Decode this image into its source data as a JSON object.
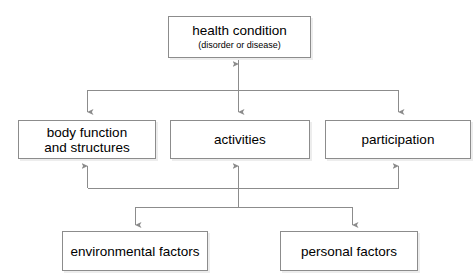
{
  "diagram": {
    "type": "flow-diagram",
    "background_color": "#ffffff",
    "line_color": "#8c8c8c",
    "box_border_color": "#8c8c8c",
    "box_fill_color": "#ffffff",
    "text_color": "#000000",
    "nodes": [
      {
        "id": "health_condition",
        "title": "health condition",
        "subtitle": "(disorder or disease)",
        "row": "top"
      },
      {
        "id": "body_function",
        "title": "body function\nand structures",
        "subtitle": "",
        "row": "middle"
      },
      {
        "id": "activities",
        "title": "activities",
        "subtitle": "",
        "row": "middle"
      },
      {
        "id": "participation",
        "title": "participation",
        "subtitle": "",
        "row": "middle"
      },
      {
        "id": "environmental_factors",
        "title": "environmental factors",
        "subtitle": "",
        "row": "bottom"
      },
      {
        "id": "personal_factors",
        "title": "personal factors",
        "subtitle": "",
        "row": "bottom"
      }
    ],
    "edges": [
      {
        "from": "health_condition",
        "to": "body_function",
        "arrow": "single-down"
      },
      {
        "from": "health_condition",
        "to": "activities",
        "arrow": "double-vertical"
      },
      {
        "from": "health_condition",
        "to": "participation",
        "arrow": "single-down"
      },
      {
        "from": "environmental_factors",
        "to": "body_function",
        "arrow": "single-up"
      },
      {
        "from": "environmental_factors",
        "to": "activities",
        "arrow": "single-up"
      },
      {
        "from": "environmental_factors",
        "to": "participation",
        "arrow": "single-up"
      },
      {
        "from": "personal_factors",
        "to": "body_function",
        "arrow": "single-up"
      },
      {
        "from": "personal_factors",
        "to": "activities",
        "arrow": "single-up"
      },
      {
        "from": "personal_factors",
        "to": "participation",
        "arrow": "single-up"
      }
    ]
  }
}
